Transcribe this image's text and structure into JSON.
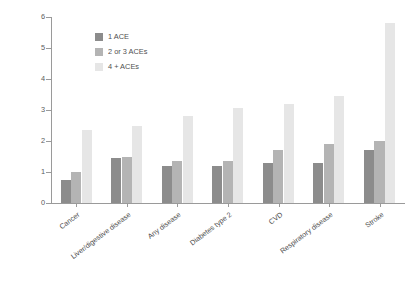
{
  "chart_data": {
    "type": "bar",
    "title": "",
    "xlabel": "",
    "ylabel": "Adjusted Hazard Ratio",
    "ylim": [
      0,
      6
    ],
    "yticks": [
      0,
      1,
      2,
      3,
      4,
      5,
      6
    ],
    "ytick_labels": [
      "0",
      "1",
      "2",
      "3",
      "4",
      "5",
      "6"
    ],
    "grid": false,
    "legend_position": "upper left inside",
    "categories": [
      "Cancer",
      "Liver/digestive disease",
      "Any disease",
      "Diabetes type 2",
      "CVD",
      "Respiratory disease",
      "Stroke"
    ],
    "series": [
      {
        "name": "1 ACE",
        "color": "#8c8c8c",
        "values": [
          0.75,
          1.45,
          1.2,
          1.2,
          1.3,
          1.3,
          1.7
        ]
      },
      {
        "name": "2 or 3 ACEs",
        "color": "#b4b4b4",
        "values": [
          1.0,
          1.5,
          1.35,
          1.35,
          1.7,
          1.9,
          2.0
        ]
      },
      {
        "name": "4 + ACEs",
        "color": "#e6e6e6",
        "values": [
          2.35,
          2.5,
          2.8,
          3.05,
          3.2,
          3.45,
          5.8
        ]
      }
    ]
  },
  "legend": {
    "items": [
      {
        "label": "1 ACE",
        "color": "#8c8c8c"
      },
      {
        "label": "2 or 3 ACEs",
        "color": "#b4b4b4"
      },
      {
        "label": "4 + ACEs",
        "color": "#e6e6e6"
      }
    ]
  }
}
